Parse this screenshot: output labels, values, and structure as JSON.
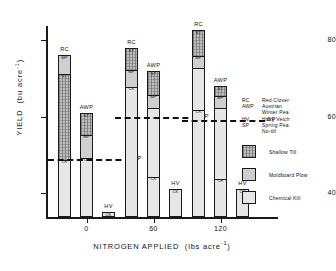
{
  "chart_data": {
    "type": "bar",
    "title": "",
    "xlabel": "NITROGEN APPLIED  (lbs acre-1)",
    "ylabel": "YIELD  (bu acre-1)",
    "ylim": [
      30,
      84
    ],
    "ytick_values": [
      40,
      60,
      80
    ],
    "ytick_labels": [
      "40",
      "60",
      "80"
    ],
    "xtick_labels": [
      "0",
      "60",
      "120"
    ],
    "grid": false,
    "legend_position": "right",
    "stack_order_note": "Each bar is a stacked column of three tillage treatments; segment labels printed inside bar",
    "groups": [
      {
        "nitrogen": "0",
        "bars": [
          {
            "crop_code": "RC",
            "total": 76.0,
            "segments": [
              {
                "code": "ST",
                "label": "ST",
                "top": 71.5,
                "bottom": 49.0,
                "fill": "shallow-till"
              },
              {
                "code": "MP",
                "label": "MP",
                "top": 76.0,
                "bottom": 71.5,
                "fill": "moldboard-plow"
              },
              {
                "code": "CK",
                "label": "CK",
                "top": 49.0,
                "bottom": 30.0,
                "fill": "chemical-kill"
              }
            ]
          },
          {
            "crop_code": "AWP",
            "total": 61.0,
            "segments": [
              {
                "code": "ST",
                "label": "ST",
                "top": 61.0,
                "bottom": 55.5,
                "fill": "shallow-till"
              },
              {
                "code": "MP",
                "label": "MP",
                "top": 55.5,
                "bottom": 49.5,
                "fill": "moldboard-plow"
              },
              {
                "code": "CK",
                "label": "CK",
                "top": 49.5,
                "bottom": 30.0,
                "fill": "chemical-kill"
              }
            ]
          },
          {
            "crop_code": "HV",
            "total": 35.0,
            "segments": [
              {
                "code": "CK",
                "label": "CK",
                "top": 35.0,
                "bottom": 30.0,
                "fill": "chemical-kill"
              }
            ]
          }
        ],
        "sp_reference": 49.0
      },
      {
        "nitrogen": "60",
        "bars": [
          {
            "crop_code": "RC",
            "total": 78.0,
            "segments": [
              {
                "code": "ST",
                "label": "ST",
                "top": 78.0,
                "bottom": 72.5,
                "fill": "shallow-till"
              },
              {
                "code": "MP",
                "label": "MP",
                "top": 72.5,
                "bottom": 68.0,
                "fill": "moldboard-plow"
              },
              {
                "code": "CK",
                "label": "CK",
                "top": 68.0,
                "bottom": 30.0,
                "fill": "chemical-kill"
              }
            ]
          },
          {
            "crop_code": "AWP",
            "total": 72.0,
            "segments": [
              {
                "code": "ST",
                "label": "ST",
                "top": 72.0,
                "bottom": 66.0,
                "fill": "shallow-till"
              },
              {
                "code": "MP",
                "label": "MP",
                "top": 66.0,
                "bottom": 62.5,
                "fill": "moldboard-plow"
              },
              {
                "code": "CK",
                "label": "CK",
                "top": 44.5,
                "bottom": 30.0,
                "fill": "chemical-kill"
              }
            ]
          },
          {
            "crop_code": "HV",
            "total": 41.0,
            "segments": [
              {
                "code": "CK",
                "label": "CK",
                "top": 41.0,
                "bottom": 30.0,
                "fill": "chemical-kill"
              }
            ]
          }
        ],
        "sp_reference": 60.0
      },
      {
        "nitrogen": "120",
        "bars": [
          {
            "crop_code": "RC",
            "total": 82.5,
            "segments": [
              {
                "code": "ST",
                "label": "ST",
                "top": 82.5,
                "bottom": 76.0,
                "fill": "shallow-till"
              },
              {
                "code": "MP",
                "label": "MP",
                "top": 76.0,
                "bottom": 73.0,
                "fill": "moldboard-plow"
              },
              {
                "code": "CK",
                "label": "CK",
                "top": 62.0,
                "bottom": 30.0,
                "fill": "chemical-kill"
              }
            ]
          },
          {
            "crop_code": "AWP",
            "total": 68.0,
            "segments": [
              {
                "code": "ST",
                "label": "ST",
                "top": 68.0,
                "bottom": 65.5,
                "fill": "shallow-till"
              },
              {
                "code": "MP",
                "label": "MP",
                "top": 65.5,
                "bottom": 62.5,
                "fill": "moldboard-plow"
              },
              {
                "code": "CK",
                "label": "CK",
                "top": 44.0,
                "bottom": 30.0,
                "fill": "chemical-kill"
              }
            ]
          },
          {
            "crop_code": "HV",
            "total": 41.0,
            "segments": [
              {
                "code": "CK",
                "label": "CK",
                "top": 41.0,
                "bottom": 30.0,
                "fill": "chemical-kill"
              }
            ]
          }
        ],
        "sp_reference": 59.0
      }
    ],
    "reference_line_label": "SP"
  },
  "legend": {
    "codes": [
      {
        "code": "RC",
        "name": "Red Clover"
      },
      {
        "code": "AWP",
        "name": "Austrian"
      },
      {
        "code": "",
        "name": "Winter Pea"
      },
      {
        "code": "HV",
        "name": "Hairy Vetch"
      },
      {
        "code": "SP",
        "name": "Spring Pea"
      },
      {
        "code": "",
        "name": "No-till"
      }
    ],
    "swatches": [
      {
        "key": "shallow-till",
        "label": "Shallow Till"
      },
      {
        "key": "moldboard-plow",
        "label": "Moldboard Plow"
      },
      {
        "key": "chemical-kill",
        "label": "Chemical Kill"
      }
    ]
  }
}
